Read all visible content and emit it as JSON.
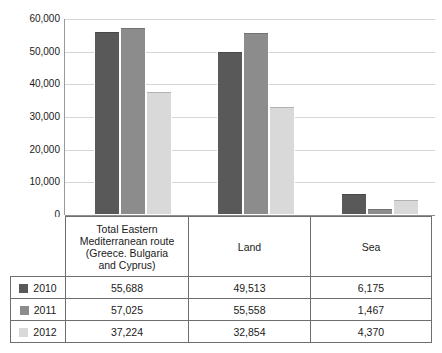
{
  "chart_data": {
    "type": "bar",
    "title": "",
    "subtitle": "",
    "xlabel": "",
    "ylabel": "",
    "categories": [
      "Total Eastern Mediterranean route (Greece. Bulgaria and Cyprus)",
      "Land",
      "Sea"
    ],
    "series": [
      {
        "name": "2010",
        "color": "#595959",
        "values": [
          55688,
          49513,
          6175
        ]
      },
      {
        "name": "2011",
        "color": "#8c8c8c",
        "values": [
          57025,
          55558,
          1467
        ]
      },
      {
        "name": "2012",
        "color": "#d9d9d9",
        "values": [
          37224,
          32854,
          4370
        ]
      }
    ],
    "ylim": [
      0,
      60000
    ],
    "ytick_values": [
      0,
      10000,
      20000,
      30000,
      40000,
      50000,
      60000
    ],
    "ytick_labels": [
      "0",
      "10,000",
      "20,000",
      "30,000",
      "40,000",
      "50,000",
      "60,000"
    ],
    "grid": "horizontal",
    "legend_position": "table-left-column"
  },
  "table": {
    "header": {
      "corner_label": "",
      "columns": [
        "Total Eastern Mediterranean route (Greece. Bulgaria and Cyprus)",
        "Land",
        "Sea"
      ],
      "column_lines": [
        [
          "Total Eastern",
          "Mediterranean route",
          "(Greece. Bulgaria",
          "and Cyprus)"
        ],
        [
          "Land"
        ],
        [
          "Sea"
        ]
      ]
    },
    "rows": [
      {
        "year": "2010",
        "swatch_color": "#595959",
        "values": [
          "55,688",
          "49,513",
          "6,175"
        ]
      },
      {
        "year": "2011",
        "swatch_color": "#8c8c8c",
        "values": [
          "57,025",
          "55,558",
          "1,467"
        ]
      },
      {
        "year": "2012",
        "swatch_color": "#d9d9d9",
        "values": [
          "37,224",
          "32,854",
          "4,370"
        ]
      }
    ]
  },
  "axis": {
    "ytick_labels": [
      "60,000",
      "50,000",
      "40,000",
      "30,000",
      "20,000",
      "10,000",
      "0"
    ]
  }
}
